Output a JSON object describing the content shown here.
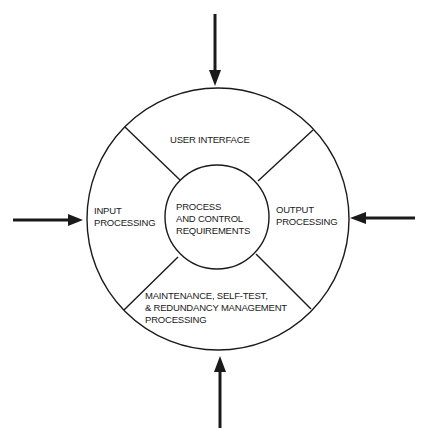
{
  "diagram": {
    "center": {
      "lines": [
        "PROCESS",
        "AND CONTROL",
        "REQUIREMENTS"
      ]
    },
    "segments": {
      "top": {
        "lines": [
          "USER INTERFACE"
        ]
      },
      "left": {
        "lines": [
          "INPUT",
          "PROCESSING"
        ]
      },
      "right": {
        "lines": [
          "OUTPUT",
          "PROCESSING"
        ]
      },
      "bottom": {
        "lines": [
          "MAINTENANCE, SELF-TEST,",
          "& REDUNDANCY MANAGEMENT",
          "PROCESSING"
        ]
      }
    },
    "arrows": [
      "top-inward",
      "left-inward",
      "right-inward",
      "bottom-inward"
    ],
    "colors": {
      "stroke": "#1a1a1a",
      "background": "#ffffff"
    }
  }
}
